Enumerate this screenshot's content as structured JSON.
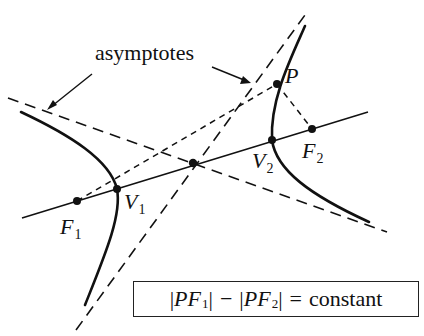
{
  "figure": {
    "type": "hyperbola-definition-diagram",
    "colors": {
      "ink": "#111111",
      "background": "#ffffff"
    }
  },
  "labels": {
    "asymptotes": "asymptotes",
    "point_P": "P",
    "focus1": {
      "main": "F",
      "sub": "1"
    },
    "focus2": {
      "main": "F",
      "sub": "2"
    },
    "vertex1": {
      "main": "V",
      "sub": "1"
    },
    "vertex2": {
      "main": "V",
      "sub": "2"
    }
  },
  "equation": {
    "part1_open": "|",
    "part1_P": "P",
    "part1_F": "F",
    "part1_sub": "1",
    "part1_close": "|",
    "minus": "−",
    "part2_open": "|",
    "part2_P": "P",
    "part2_F": "F",
    "part2_sub": "2",
    "part2_close": "|",
    "equals": "=",
    "rhs": "constant"
  },
  "geometry": {
    "center": [
      193,
      163
    ],
    "transverse_axis": {
      "from": [
        22,
        218
      ],
      "to": [
        368,
        112
      ]
    },
    "points": {
      "F1": [
        77,
        201
      ],
      "V1": [
        117,
        189
      ],
      "center": [
        193,
        163
      ],
      "V2": [
        272,
        140
      ],
      "F2": [
        312,
        129
      ],
      "P": [
        277,
        84
      ]
    },
    "asymptote_1": {
      "from": [
        8,
        98
      ],
      "to": [
        387,
        232
      ],
      "style": "dashed"
    },
    "asymptote_2": {
      "from": [
        76,
        330
      ],
      "to": [
        305,
        15
      ],
      "style": "dashed"
    },
    "focal_radii": [
      {
        "from": [
          77,
          201
        ],
        "to": [
          277,
          84
        ],
        "style": "dashed"
      },
      {
        "from": [
          277,
          84
        ],
        "to": [
          312,
          129
        ],
        "style": "dashed"
      }
    ]
  }
}
